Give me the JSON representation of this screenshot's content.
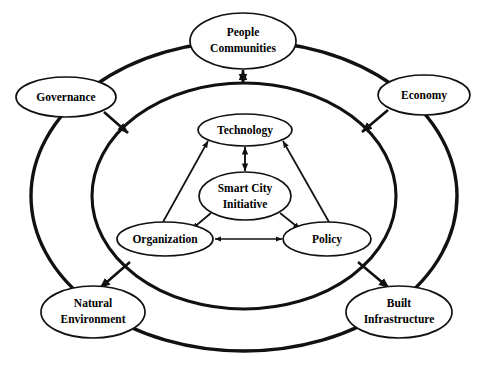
{
  "diagram": {
    "type": "concentric-ring-node-diagram",
    "colors": {
      "background": "#ffffff",
      "stroke": "#111111",
      "node_fill": "#ffffff",
      "text": "#000000"
    },
    "rings": [
      {
        "id": "outer-ring",
        "name": "outer-context-ring",
        "cx": 244,
        "cy": 196,
        "rx": 213,
        "ry": 155,
        "stroke_width": 3.2
      },
      {
        "id": "middle-ring",
        "name": "middle-components-ring",
        "cx": 244,
        "cy": 196,
        "rx": 152,
        "ry": 113,
        "stroke_width": 3.0
      }
    ],
    "nodes": [
      {
        "id": "people-communities",
        "label_lines": [
          "People",
          "Communities"
        ],
        "layer": "outer",
        "cx": 243,
        "cy": 41,
        "rx": 53,
        "ry": 28
      },
      {
        "id": "governance",
        "label_lines": [
          "Governance"
        ],
        "layer": "outer",
        "cx": 66,
        "cy": 97,
        "rx": 50,
        "ry": 20
      },
      {
        "id": "economy",
        "label_lines": [
          "Economy"
        ],
        "layer": "outer",
        "cx": 424,
        "cy": 95,
        "rx": 46,
        "ry": 20
      },
      {
        "id": "natural-environment",
        "label_lines": [
          "Natural",
          "Environment"
        ],
        "layer": "outer",
        "cx": 93,
        "cy": 312,
        "rx": 52,
        "ry": 26
      },
      {
        "id": "built-infrastructure",
        "label_lines": [
          "Built",
          "Infrastructure"
        ],
        "layer": "outer",
        "cx": 399,
        "cy": 312,
        "rx": 53,
        "ry": 26
      },
      {
        "id": "technology",
        "label_lines": [
          "Technology"
        ],
        "layer": "inner",
        "cx": 245,
        "cy": 130,
        "rx": 47,
        "ry": 16
      },
      {
        "id": "smart-city-initiative",
        "label_lines": [
          "Smart City",
          "Initiative"
        ],
        "layer": "core",
        "cx": 245,
        "cy": 196,
        "rx": 46,
        "ry": 24
      },
      {
        "id": "organization",
        "label_lines": [
          "Organization"
        ],
        "layer": "inner",
        "cx": 165,
        "cy": 239,
        "rx": 48,
        "ry": 17
      },
      {
        "id": "policy",
        "label_lines": [
          "Policy"
        ],
        "layer": "inner",
        "cx": 327,
        "cy": 239,
        "rx": 44,
        "ry": 17
      }
    ],
    "connections": [
      {
        "from": "people-communities",
        "to": "middle-ring",
        "direction": "bidirectional"
      },
      {
        "from": "governance",
        "to": "middle-ring",
        "direction": "to-ring"
      },
      {
        "from": "economy",
        "to": "middle-ring",
        "direction": "to-ring"
      },
      {
        "from": "middle-ring",
        "to": "natural-environment",
        "direction": "to-node"
      },
      {
        "from": "middle-ring",
        "to": "built-infrastructure",
        "direction": "to-node"
      },
      {
        "from": "technology",
        "to": "smart-city-initiative",
        "direction": "bidirectional"
      },
      {
        "from": "organization",
        "to": "technology",
        "direction": "to-technology"
      },
      {
        "from": "policy",
        "to": "technology",
        "direction": "to-technology"
      },
      {
        "from": "smart-city-initiative",
        "to": "organization",
        "direction": "to-organization"
      },
      {
        "from": "smart-city-initiative",
        "to": "policy",
        "direction": "to-policy"
      },
      {
        "from": "organization",
        "to": "policy",
        "direction": "bidirectional"
      }
    ]
  }
}
